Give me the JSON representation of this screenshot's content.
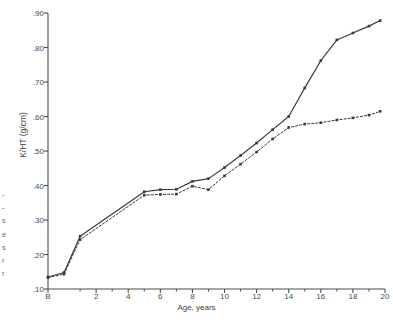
{
  "figure": {
    "background": "#ffffff",
    "ink": "#3a3a3a"
  },
  "marginal_text": {
    "name": "facing-page-bleed",
    "lines": [
      "-",
      "-",
      "s",
      "e",
      "s",
      "r",
      "r"
    ]
  },
  "chart_data": {
    "type": "line",
    "title": "",
    "xlabel": "Age, years",
    "ylabel": "K/HT (g/cm)",
    "xlim": [
      -1,
      20
    ],
    "ylim": [
      0.1,
      0.9
    ],
    "grid": false,
    "legend": "none",
    "x_tick_labels": [
      "B",
      "2",
      "4",
      "6",
      "8",
      "10",
      "12",
      "14",
      "16",
      "18",
      "20"
    ],
    "x_tick_values": [
      -1,
      2,
      4,
      6,
      8,
      10,
      12,
      14,
      16,
      18,
      20
    ],
    "x_minor_ticks": [
      1,
      3,
      5,
      7,
      9,
      11,
      13,
      15,
      17,
      19
    ],
    "y_tick_labels": [
      ".10",
      ".20",
      ".30",
      ".40",
      ".50",
      ".60",
      ".70",
      ".80",
      ".90"
    ],
    "y_tick_values": [
      0.1,
      0.2,
      0.3,
      0.4,
      0.5,
      0.6,
      0.7,
      0.8,
      0.9
    ],
    "series": [
      {
        "name": "solid-curve",
        "style": "solid",
        "color": "#3a3a3a",
        "marker": "square",
        "x": [
          -1,
          0,
          1,
          5,
          6,
          7,
          8,
          9,
          10,
          11,
          12,
          13,
          14,
          15,
          16,
          17,
          18,
          19,
          19.7
        ],
        "values": [
          0.135,
          0.148,
          0.253,
          0.382,
          0.388,
          0.389,
          0.412,
          0.42,
          0.452,
          0.487,
          0.523,
          0.562,
          0.6,
          0.683,
          0.762,
          0.822,
          0.842,
          0.862,
          0.878
        ]
      },
      {
        "name": "dashed-curve",
        "style": "dashed",
        "color": "#3a3a3a",
        "marker": "square",
        "x": [
          -1,
          0,
          1,
          5,
          6,
          7,
          8,
          9,
          10,
          11,
          12,
          13,
          14,
          15,
          16,
          17,
          18,
          19,
          19.7
        ],
        "values": [
          0.133,
          0.143,
          0.243,
          0.372,
          0.374,
          0.375,
          0.398,
          0.388,
          0.428,
          0.462,
          0.497,
          0.535,
          0.568,
          0.578,
          0.582,
          0.59,
          0.596,
          0.604,
          0.615
        ]
      }
    ]
  }
}
